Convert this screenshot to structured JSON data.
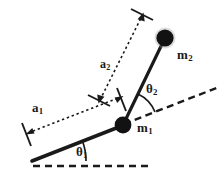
{
  "figure": {
    "background_color": "#ffffff",
    "ink_color": "#1a1a1a",
    "width": 224,
    "height": 175
  },
  "labels": {
    "mass1": {
      "base": "m",
      "sub": "1"
    },
    "mass2": {
      "base": "m",
      "sub": "2"
    },
    "link1_length": {
      "base": "a",
      "sub": "1"
    },
    "link2_length": {
      "base": "a",
      "sub": "2"
    },
    "angle1": {
      "base": "θ",
      "sub": "1"
    },
    "angle2": {
      "base": "θ",
      "sub": "2"
    }
  },
  "geometry": {
    "base_pivot": {
      "x": 32,
      "y": 161
    },
    "joint1": {
      "x": 123,
      "y": 125
    },
    "mass2_center": {
      "x": 165,
      "y": 38
    },
    "link1": {
      "from": [
        32,
        161
      ],
      "to": [
        123,
        125
      ],
      "style": "solid",
      "stroke_width": 3.4
    },
    "link2": {
      "from": [
        123,
        125
      ],
      "to": [
        165,
        38
      ],
      "style": "solid",
      "stroke_width": 3.0
    },
    "horizontal_reference": {
      "from": [
        32,
        166
      ],
      "to": [
        150,
        166
      ],
      "style": "dashed"
    },
    "link1_extension_reference": {
      "from": [
        123,
        125
      ],
      "to": [
        218,
        88
      ],
      "style": "dashed"
    },
    "a1_dimension_line": {
      "from": [
        26,
        134
      ],
      "to": [
        121,
        97
      ],
      "style": "dotted",
      "arrow_ends": "both"
    },
    "a2_dimension_line": {
      "from": [
        99,
        101
      ],
      "to": [
        142,
        14
      ],
      "style": "dotted",
      "arrow_ends": "both"
    },
    "theta1_arc": {
      "center": [
        32,
        161
      ],
      "radius": 52,
      "from_deg": 0,
      "to_deg": 21
    },
    "theta2_arc": {
      "center": [
        123,
        125
      ],
      "radius": 34,
      "from_deg": -21,
      "to_deg": -64
    }
  },
  "masses": [
    {
      "name": "m1",
      "cx": 123,
      "cy": 125,
      "r": 8.5,
      "fill": "#121212"
    },
    {
      "name": "m2",
      "cx": 165,
      "cy": 38,
      "r": 9.0,
      "fill": "#121212"
    }
  ]
}
